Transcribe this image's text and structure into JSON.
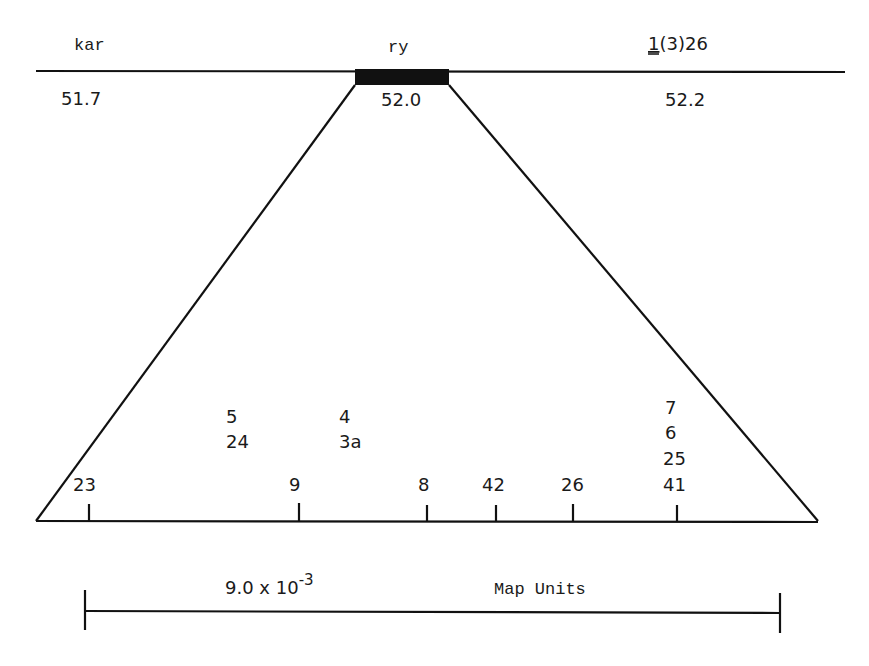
{
  "chromosome_map": {
    "loci": [
      {
        "name": "kar",
        "position": "51.7",
        "x": 75
      },
      {
        "name": "ry",
        "position": "52.0",
        "x": 402
      },
      {
        "name": "l(3)26",
        "name_display": {
          "underlined": "1",
          "rest": "(3)26"
        },
        "position": "52.2",
        "x": 690
      }
    ],
    "expanded_region_label": "ry"
  },
  "fine_map": {
    "sites": [
      {
        "label": "23",
        "x": 89
      },
      {
        "label": "9",
        "x": 299
      },
      {
        "label": "8",
        "x": 427
      },
      {
        "label": "42",
        "x": 496
      },
      {
        "label": "26",
        "x": 573
      },
      {
        "label": "41",
        "x": 677
      }
    ],
    "stacked_groups": [
      {
        "x": 238,
        "labels": [
          "5",
          "24"
        ]
      },
      {
        "x": 350,
        "labels": [
          "4",
          "3a"
        ]
      },
      {
        "x": 677,
        "labels": [
          "7",
          "6",
          "25"
        ]
      }
    ]
  },
  "scale_bar": {
    "value": "9.0 x 10",
    "exponent": "-3",
    "units": "Map Units"
  }
}
